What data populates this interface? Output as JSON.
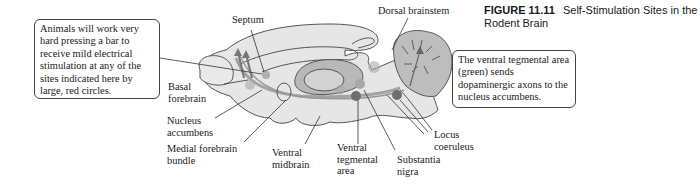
{
  "figure": {
    "number": "FIGURE 11.11",
    "title": "Self-Stimulation Sites in the Rodent Brain"
  },
  "callouts": {
    "left": "Animals will work very hard pressing a bar to receive mild electrical stimulation at any of the sites indicated here by large, red circles.",
    "right": "The ventral tegmental area (green) sends dopaminergic axons to the nucleus accumbens."
  },
  "labels": {
    "septum": "Septum",
    "dorsal_brainstem": "Dorsal brainstem",
    "basal_forebrain": "Basal\nforebrain",
    "nucleus_accumbens": "Nucleus\naccumbens",
    "medial_forebrain_bundle": "Medial forebrain\nbundle",
    "ventral_midbrain": "Ventral\nmidbrain",
    "ventral_tegmental_area": "Ventral\ntegmental\narea",
    "substantia_nigra": "Substantia\nnigra",
    "locus_coeruleus": "Locus\ncoeruleus"
  },
  "colors": {
    "brain_fill": "#e6e6e6",
    "brain_stroke": "#555555",
    "cerebellum_fill": "#bdbdbd",
    "stim_site": "#6e6e6e",
    "vta_site": "#a8a8a8",
    "leader_line": "#333333"
  }
}
